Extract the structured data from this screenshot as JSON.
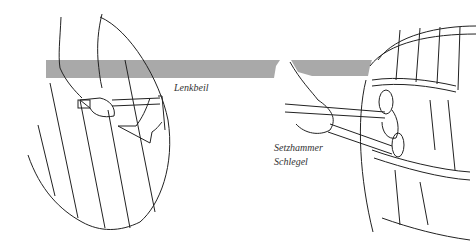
{
  "illustration": {
    "band_color": "#a9a9a9",
    "labels": {
      "left_tool": "Lenkbeil",
      "right_tool_1": "Setzhammer",
      "right_tool_2": "Schlegel"
    }
  }
}
